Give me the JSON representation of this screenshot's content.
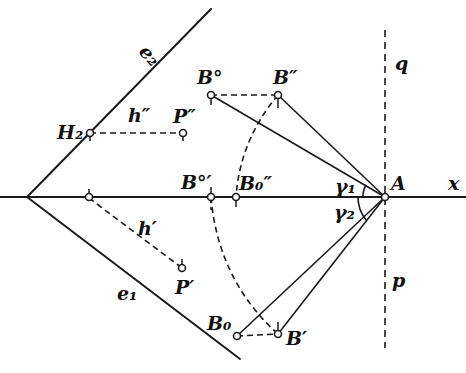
{
  "figure": {
    "colors": {
      "ink": "#1a1a1a",
      "background": "#ffffff"
    }
  },
  "labels": {
    "e2": "e₂",
    "e1": "e₁",
    "H2": "H₂",
    "h_double": "h″",
    "P_double": "P″",
    "h_single": "h′",
    "P_single": "P′",
    "B0_upper": "B°",
    "B_double": "B″",
    "B0_prime": "B°′",
    "B0_double": "B₀″",
    "B_zero": "B₀",
    "B_single": "B′",
    "A": "A",
    "x": "x",
    "q": "q",
    "p": "p",
    "gamma1": "γ₁",
    "gamma2": "γ₂"
  }
}
